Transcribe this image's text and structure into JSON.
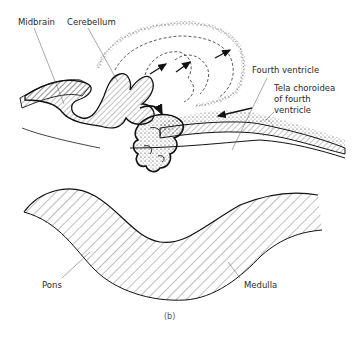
{
  "figure": {
    "caption": "(b)",
    "labels": {
      "midbrain": "Midbrain",
      "cerebellum": "Cerebellum",
      "fourth_ventricle": "Fourth ventricle",
      "tela_line1": "Tela choroidea",
      "tela_line2": "of fourth",
      "tela_line3": "ventricle",
      "pons": "Pons",
      "medulla": "Medulla"
    }
  }
}
